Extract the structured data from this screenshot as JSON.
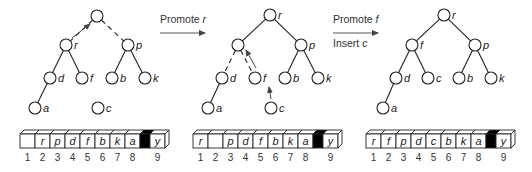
{
  "colors": {
    "stroke": "#222222",
    "arrow": "#444444",
    "fill": "#ffffff",
    "separator": "#000000"
  },
  "transitions": [
    {
      "line1_prefix": "Promote ",
      "line1_var": "r",
      "line2_prefix": "",
      "line2_var": ""
    },
    {
      "line1_prefix": "Promote ",
      "line1_var": "f",
      "line2_prefix": "Insert ",
      "line2_var": "c"
    }
  ],
  "panels": [
    {
      "nodes": [
        {
          "id": "root",
          "label": "",
          "x": 97,
          "y": 16
        },
        {
          "id": "r",
          "label": "r",
          "x": 66,
          "y": 45
        },
        {
          "id": "p",
          "label": "p",
          "x": 128,
          "y": 45
        },
        {
          "id": "d",
          "label": "d",
          "x": 50,
          "y": 78
        },
        {
          "id": "f",
          "label": "f",
          "x": 82,
          "y": 78
        },
        {
          "id": "b",
          "label": "b",
          "x": 112,
          "y": 78
        },
        {
          "id": "k",
          "label": "k",
          "x": 145,
          "y": 78
        },
        {
          "id": "a",
          "label": "a",
          "x": 35,
          "y": 108
        },
        {
          "id": "c",
          "label": "c",
          "x": 98,
          "y": 108
        }
      ],
      "edges": [
        {
          "from": "root",
          "to": "r",
          "dashed": true
        },
        {
          "from": "root",
          "to": "p",
          "dashed": true
        },
        {
          "from": "r",
          "to": "d",
          "dashed": false
        },
        {
          "from": "r",
          "to": "f",
          "dashed": false
        },
        {
          "from": "p",
          "to": "b",
          "dashed": false
        },
        {
          "from": "p",
          "to": "k",
          "dashed": false
        },
        {
          "from": "d",
          "to": "a",
          "dashed": false
        }
      ],
      "arrows": [
        {
          "x1": 72,
          "y1": 38,
          "x2": 90,
          "y2": 24
        }
      ],
      "array": {
        "x": 20,
        "cells": [
          "",
          "r",
          "p",
          "d",
          "f",
          "b",
          "k",
          "a"
        ],
        "last": "y",
        "indices": [
          "1",
          "2",
          "3",
          "4",
          "5",
          "6",
          "7",
          "8",
          "9"
        ]
      }
    },
    {
      "nodes": [
        {
          "id": "r",
          "label": "r",
          "x": 270,
          "y": 15
        },
        {
          "id": "hole",
          "label": "",
          "x": 238,
          "y": 45
        },
        {
          "id": "p",
          "label": "p",
          "x": 301,
          "y": 45
        },
        {
          "id": "d",
          "label": "d",
          "x": 222,
          "y": 78
        },
        {
          "id": "f",
          "label": "f",
          "x": 255,
          "y": 78
        },
        {
          "id": "b",
          "label": "b",
          "x": 285,
          "y": 78
        },
        {
          "id": "k",
          "label": "k",
          "x": 318,
          "y": 78
        },
        {
          "id": "a",
          "label": "a",
          "x": 208,
          "y": 108
        },
        {
          "id": "c",
          "label": "c",
          "x": 271,
          "y": 108
        }
      ],
      "edges": [
        {
          "from": "r",
          "to": "hole",
          "dashed": false
        },
        {
          "from": "r",
          "to": "p",
          "dashed": false
        },
        {
          "from": "hole",
          "to": "d",
          "dashed": true
        },
        {
          "from": "hole",
          "to": "f",
          "dashed": true
        },
        {
          "from": "p",
          "to": "b",
          "dashed": false
        },
        {
          "from": "p",
          "to": "k",
          "dashed": false
        },
        {
          "from": "d",
          "to": "a",
          "dashed": false
        }
      ],
      "arrows": [
        {
          "x1": 256,
          "y1": 68,
          "x2": 246,
          "y2": 50
        },
        {
          "x1": 271,
          "y1": 99,
          "x2": 269,
          "y2": 87
        }
      ],
      "array": {
        "x": 193,
        "cells": [
          "r",
          "",
          "p",
          "d",
          "f",
          "b",
          "k",
          "a"
        ],
        "last": "y",
        "indices": [
          "1",
          "2",
          "3",
          "4",
          "5",
          "6",
          "7",
          "8",
          "9"
        ]
      }
    },
    {
      "nodes": [
        {
          "id": "r",
          "label": "r",
          "x": 444,
          "y": 15
        },
        {
          "id": "f",
          "label": "f",
          "x": 412,
          "y": 45
        },
        {
          "id": "p",
          "label": "p",
          "x": 475,
          "y": 45
        },
        {
          "id": "d",
          "label": "d",
          "x": 396,
          "y": 78
        },
        {
          "id": "c",
          "label": "c",
          "x": 428,
          "y": 78
        },
        {
          "id": "b",
          "label": "b",
          "x": 459,
          "y": 78
        },
        {
          "id": "k",
          "label": "k",
          "x": 491,
          "y": 78
        },
        {
          "id": "a",
          "label": "a",
          "x": 383,
          "y": 108
        }
      ],
      "edges": [
        {
          "from": "r",
          "to": "f",
          "dashed": false
        },
        {
          "from": "r",
          "to": "p",
          "dashed": false
        },
        {
          "from": "f",
          "to": "d",
          "dashed": false
        },
        {
          "from": "f",
          "to": "c",
          "dashed": false
        },
        {
          "from": "p",
          "to": "b",
          "dashed": false
        },
        {
          "from": "p",
          "to": "k",
          "dashed": false
        },
        {
          "from": "d",
          "to": "a",
          "dashed": false
        }
      ],
      "arrows": [],
      "array": {
        "x": 366,
        "cells": [
          "r",
          "f",
          "p",
          "d",
          "c",
          "b",
          "k",
          "a"
        ],
        "last": "y",
        "indices": [
          "1",
          "2",
          "3",
          "4",
          "5",
          "6",
          "7",
          "8",
          "9"
        ]
      }
    }
  ]
}
